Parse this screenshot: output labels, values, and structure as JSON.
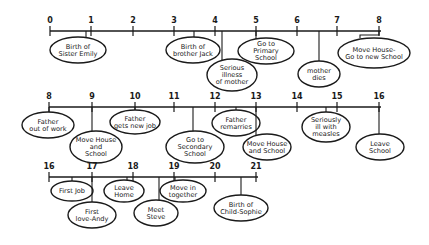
{
  "diagram": {
    "type": "timeline",
    "rows": [
      {
        "axis_y": 31,
        "x_start": 50,
        "x_end": 381,
        "ticks": [
          {
            "label": "0",
            "x": 50
          },
          {
            "label": "1",
            "x": 91
          },
          {
            "label": "2",
            "x": 133
          },
          {
            "label": "3",
            "x": 174
          },
          {
            "label": "4",
            "x": 215
          },
          {
            "label": "5",
            "x": 256
          },
          {
            "label": "6",
            "x": 297
          },
          {
            "label": "7",
            "x": 337
          },
          {
            "label": "8",
            "x": 379
          }
        ],
        "events": [
          {
            "lines": [
              "Birth of",
              "Sister Emily"
            ],
            "anchor_x": 86,
            "cx": 78,
            "cy": 50,
            "rx": 28,
            "ry": 13
          },
          {
            "lines": [
              "Birth of",
              "brother Jack"
            ],
            "anchor_x": 194,
            "cx": 193,
            "cy": 50,
            "rx": 27,
            "ry": 13
          },
          {
            "lines": [
              "Serious",
              "illness",
              "of mother"
            ],
            "anchor_x": 222,
            "cx": 232,
            "cy": 75,
            "rx": 25,
            "ry": 16
          },
          {
            "lines": [
              "Go to",
              "Primary",
              "School"
            ],
            "anchor_x": 256,
            "cx": 266,
            "cy": 51,
            "rx": 28,
            "ry": 13
          },
          {
            "lines": [
              "mother",
              "dies"
            ],
            "anchor_x": 319,
            "cx": 319,
            "cy": 74,
            "rx": 21,
            "ry": 13
          },
          {
            "lines": [
              "Move House-",
              "Go to new School"
            ],
            "anchor_x": 360,
            "bracket_to": 379,
            "cx": 374,
            "cy": 53,
            "rx": 36,
            "ry": 15
          }
        ]
      },
      {
        "axis_y": 107,
        "x_start": 49,
        "x_end": 381,
        "ticks": [
          {
            "label": "8",
            "x": 49
          },
          {
            "label": "9",
            "x": 92
          },
          {
            "label": "10",
            "x": 135
          },
          {
            "label": "11",
            "x": 174
          },
          {
            "label": "12",
            "x": 215
          },
          {
            "label": "13",
            "x": 256
          },
          {
            "label": "14",
            "x": 297
          },
          {
            "label": "15",
            "x": 337
          },
          {
            "label": "16",
            "x": 379
          }
        ],
        "events": [
          {
            "lines": [
              "Father",
              "out of work"
            ],
            "anchor_x": 49,
            "cx": 48,
            "cy": 125,
            "rx": 26,
            "ry": 13
          },
          {
            "lines": [
              "Move House",
              "and",
              "School"
            ],
            "anchor_x": 92,
            "cx": 96,
            "cy": 147,
            "rx": 26,
            "ry": 16
          },
          {
            "lines": [
              "Father",
              "gets new job"
            ],
            "anchor_x": 135,
            "cx": 135,
            "cy": 122,
            "rx": 25,
            "ry": 12
          },
          {
            "lines": [
              "Go to",
              "Secondary",
              "School"
            ],
            "anchor_x": 193,
            "cx": 195,
            "cy": 147,
            "rx": 29,
            "ry": 16
          },
          {
            "lines": [
              "Father",
              "remarries"
            ],
            "anchor_x": 236,
            "cx": 236,
            "cy": 123,
            "rx": 24,
            "ry": 13
          },
          {
            "lines": [
              "Move House",
              "and School"
            ],
            "anchor_x": 256,
            "cx": 267,
            "cy": 147,
            "rx": 24,
            "ry": 13
          },
          {
            "lines": [
              "Seriously",
              "ill with",
              "measles"
            ],
            "anchor_x": 326,
            "cx": 326,
            "cy": 127,
            "rx": 24,
            "ry": 15
          },
          {
            "lines": [
              "Leave",
              "School"
            ],
            "anchor_x": 379,
            "cx": 380,
            "cy": 147,
            "rx": 24,
            "ry": 13
          }
        ]
      },
      {
        "axis_y": 177,
        "x_start": 49,
        "x_end": 258,
        "ticks": [
          {
            "label": "16",
            "x": 49
          },
          {
            "label": "17",
            "x": 92
          },
          {
            "label": "18",
            "x": 133
          },
          {
            "label": "19",
            "x": 174
          },
          {
            "label": "20",
            "x": 215
          },
          {
            "label": "21",
            "x": 256
          }
        ],
        "events": [
          {
            "lines": [
              "First Job"
            ],
            "anchor_x": 72,
            "cx": 72,
            "cy": 191,
            "rx": 21,
            "ry": 10
          },
          {
            "lines": [
              "First",
              "love-Andy"
            ],
            "anchor_x": 92,
            "cx": 92,
            "cy": 215,
            "rx": 24,
            "ry": 13
          },
          {
            "lines": [
              "Leave",
              "Home"
            ],
            "anchor_x": 127,
            "cx": 124,
            "cy": 191,
            "rx": 20,
            "ry": 11
          },
          {
            "lines": [
              "Meet",
              "Steve"
            ],
            "anchor_x": 159,
            "cx": 156,
            "cy": 213,
            "rx": 22,
            "ry": 13
          },
          {
            "lines": [
              "Move in",
              "together"
            ],
            "anchor_x": 175,
            "cx": 183,
            "cy": 191,
            "rx": 23,
            "ry": 11
          },
          {
            "lines": [
              "Birth of",
              "Child-Sophie"
            ],
            "anchor_x": 241,
            "cx": 241,
            "cy": 208,
            "rx": 27,
            "ry": 13
          }
        ]
      }
    ]
  }
}
